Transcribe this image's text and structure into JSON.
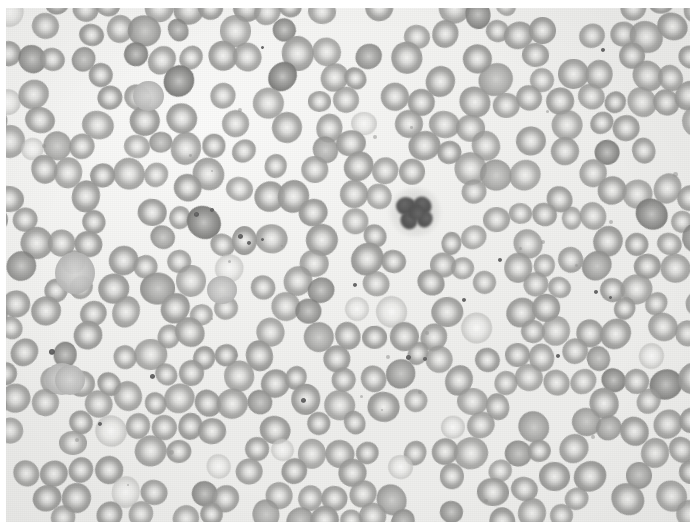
{
  "image": {
    "kind": "light-microscopy-photomicrograph",
    "subject": "peripheral blood smear",
    "stain": "Romanowsky / Wright-Giemsa (reproduced in greyscale)",
    "caption": "Greyscale photomicrograph of a peripheral blood smear: a dense monolayer of erythrocytes with central pallor, a single leukocyte with a dark segmented nucleus just right of centre, and scattered platelets.",
    "width": 698,
    "height": 530,
    "margins": {
      "left": 6,
      "top": 8,
      "right": 8,
      "bottom": 8
    }
  },
  "palette": {
    "paper": "#ffffff",
    "background": "#f4f4f2",
    "background_light": "#fbfbfa",
    "rbc_rim": "#969694",
    "rbc_body": "#a3a3a1",
    "rbc_pallor": "#f0f0ee",
    "rbc_dark": "#7c7c7a",
    "rbc_pale": "#e8e8e6",
    "polychromatophil": "#b2b2b1",
    "wbc_nucleus": "#4c4c4c",
    "wbc_cytoplasm": "#bcbcba",
    "platelet": "#5d5d5d"
  },
  "features": {
    "erythrocyte_count_visible": 330,
    "leukocyte_count_visible": 1,
    "platelet_count_visible": 14,
    "typical_rbc_diameter_px": 28
  },
  "leukocyte": {
    "label": "leukocyte-segmented-nucleus",
    "center_x": 415,
    "center_y": 212,
    "halo_diameter_px": 52,
    "nucleus_lobes": 4
  }
}
